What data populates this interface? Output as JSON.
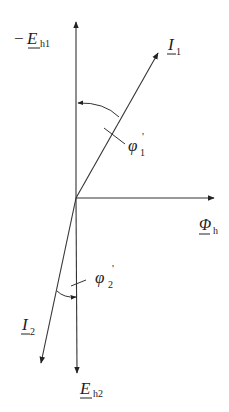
{
  "diagram": {
    "type": "phasor-diagram",
    "stroke_color": "#333333",
    "phasors": [
      {
        "id": "neg_Eh1",
        "label_prefix": "−",
        "label_main": "E",
        "label_sub": "h1",
        "direction": "up"
      },
      {
        "id": "I1",
        "label_main": "I",
        "label_sub": "1",
        "direction": "up-right"
      },
      {
        "id": "Phi_h",
        "label_main": "Φ",
        "label_sub": "h",
        "direction": "right"
      },
      {
        "id": "I2",
        "label_main": "I",
        "label_sub": "2",
        "direction": "down-left"
      },
      {
        "id": "Eh2",
        "label_main": "E",
        "label_sub": "h2",
        "direction": "down"
      }
    ],
    "angles": [
      {
        "id": "phi1",
        "label_main": "φ",
        "label_sub": "1",
        "label_prime": "'",
        "between": [
          "I1",
          "neg_Eh1"
        ]
      },
      {
        "id": "phi2",
        "label_main": "φ",
        "label_sub": "2",
        "label_prime": "'",
        "between": [
          "I2",
          "Eh2"
        ]
      }
    ]
  }
}
